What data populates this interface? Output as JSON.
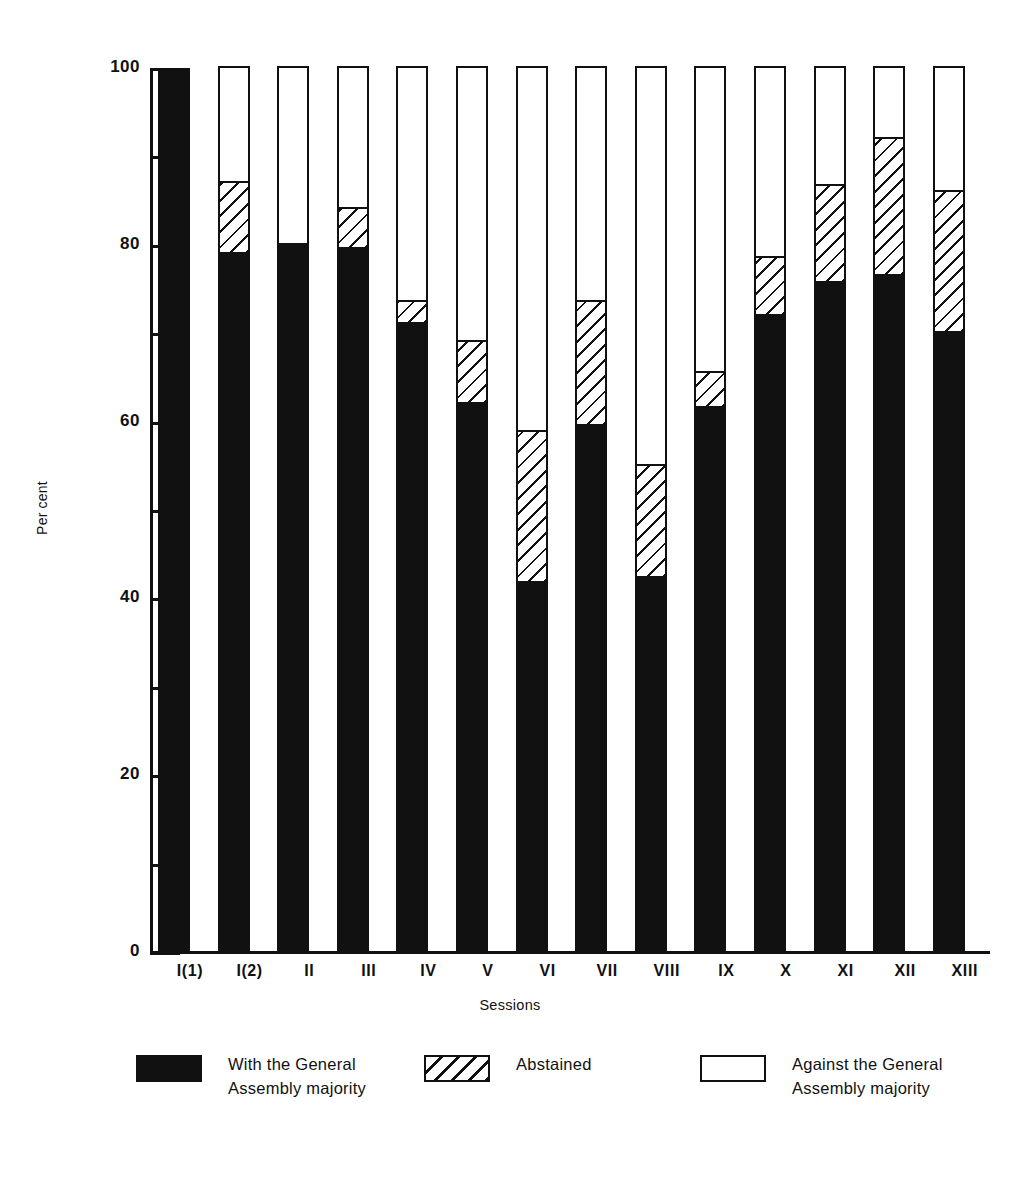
{
  "chart_data": {
    "type": "bar",
    "title": "",
    "subtitle": "",
    "xlabel": "Sessions",
    "ylabel": "Per cent",
    "ylim": [
      0,
      100
    ],
    "grid": false,
    "stacked": true,
    "stacked_total": 100,
    "legend_position": "bottom",
    "y_ticks_major": [
      0,
      20,
      40,
      60,
      80,
      100
    ],
    "y_ticks_minor": [
      10,
      30,
      50,
      70,
      90
    ],
    "y_tick_labels": [
      "0",
      "20",
      "40",
      "60",
      "80",
      "100"
    ],
    "categories": [
      "I(1)",
      "I(2)",
      "II",
      "III",
      "IV",
      "V",
      "VI",
      "VII",
      "VIII",
      "IX",
      "X",
      "XI",
      "XII",
      "XIII"
    ],
    "series": [
      {
        "name": "With the General Assembly majority",
        "color": "#111111",
        "pattern": "solid",
        "values": [
          100,
          79,
          80,
          79.5,
          71,
          62,
          41.8,
          59.5,
          42.3,
          61.5,
          72,
          75.7,
          76.5,
          70
        ]
      },
      {
        "name": "Abstained",
        "color": "#111111",
        "pattern": "diagonal-hatch",
        "values": [
          0,
          8,
          0,
          4.5,
          2.5,
          7,
          17,
          14,
          12.7,
          4,
          6.5,
          11,
          15.5,
          16
        ]
      },
      {
        "name": "Against the General Assembly majority",
        "color": "#ffffff",
        "pattern": "empty",
        "values": [
          0,
          13,
          20,
          16,
          26.5,
          31,
          41.2,
          26.5,
          45,
          34.5,
          21.5,
          13.3,
          8,
          14
        ]
      }
    ],
    "annotations": []
  },
  "axes": {
    "y_title": "Per cent",
    "x_title": "Sessions"
  },
  "legend": {
    "items": [
      {
        "key": "with",
        "label": "With the General\nAssembly majority",
        "swatch": "solid-black-swatch"
      },
      {
        "key": "abstained",
        "label": "Abstained",
        "swatch": "hatched-swatch"
      },
      {
        "key": "against",
        "label": "Against the General\nAssembly majority",
        "swatch": "outline-white-swatch"
      }
    ]
  },
  "colors": {
    "ink": "#111111",
    "paper": "#ffffff"
  }
}
